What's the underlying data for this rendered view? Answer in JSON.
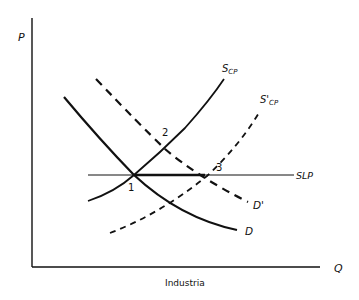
{
  "axes": {
    "y_label": "P",
    "x_label": "Q",
    "caption": "Industria"
  },
  "curves": {
    "demand": {
      "label": "D",
      "style": "solid"
    },
    "demand_shifted": {
      "label": "D'",
      "style": "dashed"
    },
    "supply_cp": {
      "label_main": "S",
      "label_sub": "CP",
      "style": "solid"
    },
    "supply_cp_shifted": {
      "label_main": "S'",
      "label_sub": "CP",
      "style": "dashed"
    },
    "long_run_supply": {
      "label": "SLP",
      "style": "solid"
    }
  },
  "points": [
    {
      "id": "1",
      "label": "1"
    },
    {
      "id": "2",
      "label": "2"
    },
    {
      "id": "3",
      "label": "3"
    }
  ],
  "colors": {
    "ink": "#111111",
    "background": "#ffffff"
  }
}
